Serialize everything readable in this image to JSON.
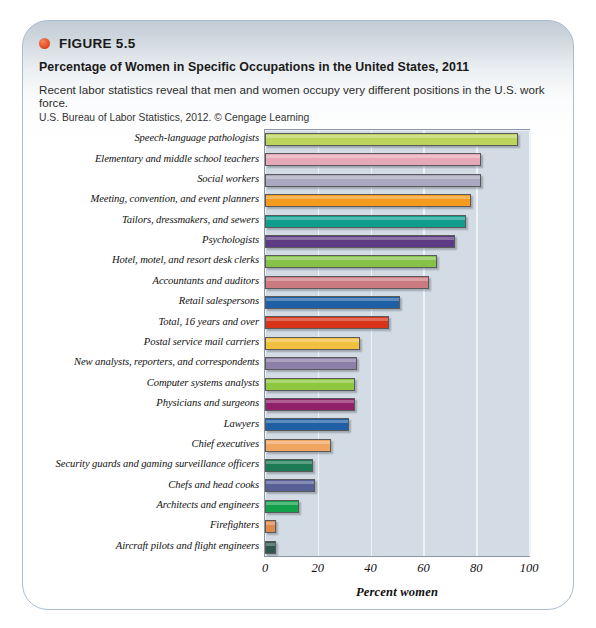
{
  "figure": {
    "label": "FIGURE 5.5",
    "title": "Percentage of Women in Specific Occupations in the United States, 2011",
    "description": "Recent labor statistics reveal that men and women occupy very different positions in the U.S. work force.",
    "source": "U.S. Bureau of Labor Statistics, 2012. © Cengage Learning",
    "bullet_color": "#e8502a"
  },
  "chart_data": {
    "type": "bar",
    "orientation": "horizontal",
    "title": "Percentage of Women in Specific Occupations in the United States, 2011",
    "xlabel": "Percent women",
    "ylabel": "",
    "xlim": [
      0,
      100
    ],
    "xticks": [
      0,
      20,
      40,
      60,
      80,
      100
    ],
    "grid": true,
    "legend": "none",
    "plot_background": "#d3dbe4",
    "categories": [
      "Speech-language pathologists",
      "Elementary and middle school teachers",
      "Social workers",
      "Meeting, convention, and event planners",
      "Tailors, dressmakers, and sewers",
      "Psychologists",
      "Hotel, motel, and resort desk clerks",
      "Accountants and auditors",
      "Retail salespersons",
      "Total, 16 years and over",
      "Postal service mail carriers",
      "New analysts, reporters, and correspondents",
      "Computer systems analysts",
      "Physicians and surgeons",
      "Lawyers",
      "Chief executives",
      "Security guards and gaming surveillance officers",
      "Chefs and head cooks",
      "Architects and engineers",
      "Firefighters",
      "Aircraft pilots and flight engineers"
    ],
    "values": [
      96,
      82,
      82,
      78,
      76,
      72,
      65,
      62,
      51,
      47,
      36,
      35,
      34,
      34,
      32,
      25,
      18,
      19,
      13,
      4,
      4
    ],
    "colors": [
      "#bcd45e",
      "#e6a8b8",
      "#a9a8c0",
      "#f49a1c",
      "#0f9e8e",
      "#5c3b84",
      "#86c24a",
      "#cb7a7f",
      "#1f5fa6",
      "#d8341a",
      "#f2c03f",
      "#8c7fa8",
      "#8dc63f",
      "#8f2069",
      "#1f5fa6",
      "#f0a661",
      "#1b7a54",
      "#585f96",
      "#12a14a",
      "#e08a4a",
      "#2f564f"
    ]
  }
}
